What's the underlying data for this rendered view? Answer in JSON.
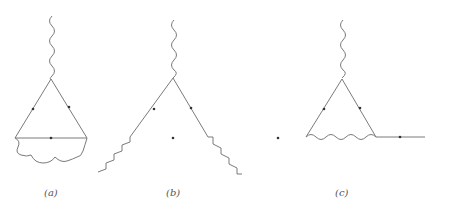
{
  "figure": {
    "type": "feynman-diagrams",
    "panels": [
      {
        "id": "a",
        "label": "(a)",
        "description": "fermion triangle loop with external photon at top and internal photon connecting bottom vertices"
      },
      {
        "id": "b",
        "label": "(b)",
        "description": "photon vertex with two fermion lines emitting photons at ends"
      },
      {
        "id": "c",
        "label": "(c)",
        "description": "fermion triangle with internal photon on bottom edge and outgoing fermion line"
      }
    ],
    "colors": {
      "line": "#7a7a7a",
      "arrow": "#333333",
      "background": "#ffffff"
    }
  }
}
